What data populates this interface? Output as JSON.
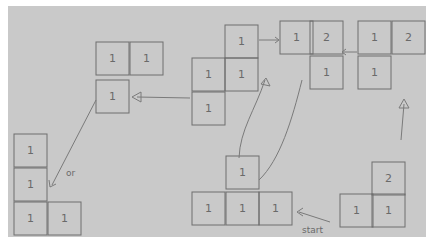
{
  "diagram": {
    "start_label": "start",
    "side_label": "or",
    "states": [
      {
        "id": "s1",
        "cells": [
          {
            "x": 340,
            "y": 194,
            "v": "1"
          },
          {
            "x": 372,
            "y": 194,
            "v": "1"
          },
          {
            "x": 372,
            "y": 162,
            "v": "2"
          }
        ]
      },
      {
        "id": "s2",
        "cells": [
          {
            "x": 192,
            "y": 192,
            "v": "1"
          },
          {
            "x": 226,
            "y": 192,
            "v": "1"
          },
          {
            "x": 259,
            "y": 192,
            "v": "1"
          },
          {
            "x": 226,
            "y": 156,
            "v": "1"
          }
        ]
      },
      {
        "id": "s3",
        "cells": [
          {
            "x": 225,
            "y": 25,
            "v": "1"
          },
          {
            "x": 192,
            "y": 58,
            "v": "1"
          },
          {
            "x": 225,
            "y": 58,
            "v": "1"
          },
          {
            "x": 192,
            "y": 92,
            "v": "1"
          }
        ]
      },
      {
        "id": "s4",
        "cells": [
          {
            "x": 280,
            "y": 21,
            "v": "1"
          },
          {
            "x": 310,
            "y": 21,
            "v": "2"
          },
          {
            "x": 310,
            "y": 56,
            "v": "1"
          }
        ]
      },
      {
        "id": "s5",
        "cells": [
          {
            "x": 358,
            "y": 21,
            "v": "1"
          },
          {
            "x": 392,
            "y": 21,
            "v": "2"
          },
          {
            "x": 358,
            "y": 56,
            "v": "1"
          }
        ]
      },
      {
        "id": "s6",
        "cells": [
          {
            "x": 96,
            "y": 42,
            "v": "1"
          },
          {
            "x": 130,
            "y": 42,
            "v": "1"
          },
          {
            "x": 96,
            "y": 80,
            "v": "1"
          }
        ]
      },
      {
        "id": "s7",
        "cells": [
          {
            "x": 14,
            "y": 134,
            "v": "1"
          },
          {
            "x": 14,
            "y": 168,
            "v": "1"
          },
          {
            "x": 14,
            "y": 202,
            "v": "1"
          },
          {
            "x": 48,
            "y": 202,
            "v": "1"
          }
        ]
      }
    ]
  }
}
